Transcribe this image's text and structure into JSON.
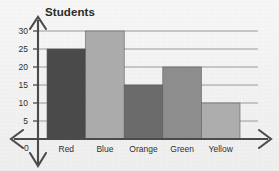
{
  "chart_data": {
    "type": "bar",
    "title": "Students",
    "xlabel": "",
    "ylabel": "",
    "categories": [
      "Red",
      "Blue",
      "Orange",
      "Green",
      "Yellow"
    ],
    "values": [
      25,
      30,
      15,
      20,
      10
    ],
    "ylim": [
      0,
      30
    ],
    "ytick_labels": [
      "0",
      "5",
      "10",
      "15",
      "20",
      "25",
      "30"
    ],
    "ytick_values": [
      0,
      5,
      10,
      15,
      20,
      25,
      30
    ],
    "grid": true,
    "grid_orientation": "horizontal",
    "legend": false,
    "legend_position": "none",
    "bar_gap": 0,
    "bar_colors": [
      "#4a4a4a",
      "#ababab",
      "#6b6b6b",
      "#8d8d8d",
      "#adadad"
    ],
    "axis_style": "cross-with-arrowheads",
    "arrowheads": [
      "up",
      "down",
      "left",
      "right"
    ],
    "origin_label": "0"
  },
  "colors": {
    "background": "#f4f4f4",
    "axis": "#4b4b4b",
    "grid": "#8e8e8e",
    "text": "#2f2f2f",
    "title_text": "#2b2b2b",
    "bar_outline": "#5d5d5d"
  }
}
